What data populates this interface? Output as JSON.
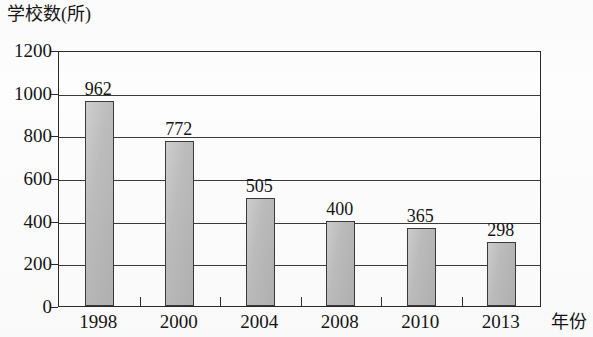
{
  "chart_data": {
    "type": "bar",
    "title": "",
    "ylabel": "学校数(所)",
    "xlabel": "年份",
    "categories": [
      "1998",
      "2000",
      "2004",
      "2008",
      "2010",
      "2013"
    ],
    "values": [
      962,
      772,
      505,
      400,
      365,
      298
    ],
    "value_labels": [
      "962",
      "772",
      "505",
      "400",
      "365",
      "298"
    ],
    "ylim": [
      0,
      1200
    ],
    "ytick_labels": [
      "0",
      "200",
      "400",
      "600",
      "800",
      "1000",
      "1200"
    ],
    "ytick_values": [
      0,
      200,
      400,
      600,
      800,
      1000,
      1200
    ],
    "grid": true,
    "legend": false,
    "series": [
      {
        "name": "学校数(所)",
        "values": [
          962,
          772,
          505,
          400,
          365,
          298
        ]
      }
    ],
    "bar_fill_color": "#b9b9b9",
    "bar_border_color": "#3b3b3b",
    "axis_color": "#2a2a2a"
  }
}
